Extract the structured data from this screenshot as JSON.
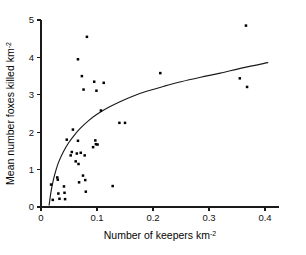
{
  "chart_data": {
    "type": "scatter",
    "title": "",
    "xlabel": "Number of keepers km-2",
    "xlabel_base": "Number of keepers km",
    "xlabel_sup": "-2",
    "ylabel": "Mean number foxes killed km-2",
    "ylabel_base": "Mean number foxes killed km",
    "ylabel_sup": "-2",
    "xlim": [
      0,
      0.4
    ],
    "ylim": [
      0,
      5
    ],
    "xticks": [
      0,
      0.1,
      0.2,
      0.3,
      0.4
    ],
    "xticklabels": [
      "0",
      "0.1",
      "0.2",
      "0.3",
      "0.4"
    ],
    "yticks": [
      0,
      1,
      2,
      3,
      4,
      5
    ],
    "yticklabels": [
      "0",
      "1",
      "2",
      "3",
      "4",
      "5"
    ],
    "grid": false,
    "legend": null,
    "marker": "square",
    "marker_color": "#000000",
    "points": [
      {
        "x": 0.018,
        "y": 0.6
      },
      {
        "x": 0.021,
        "y": 0.19
      },
      {
        "x": 0.029,
        "y": 0.79
      },
      {
        "x": 0.03,
        "y": 0.73
      },
      {
        "x": 0.031,
        "y": 0.36
      },
      {
        "x": 0.033,
        "y": 0.22
      },
      {
        "x": 0.041,
        "y": 0.55
      },
      {
        "x": 0.042,
        "y": 0.38
      },
      {
        "x": 0.043,
        "y": 0.21
      },
      {
        "x": 0.046,
        "y": 1.8
      },
      {
        "x": 0.053,
        "y": 1.38
      },
      {
        "x": 0.055,
        "y": 1.47
      },
      {
        "x": 0.057,
        "y": 2.07
      },
      {
        "x": 0.062,
        "y": 1.22
      },
      {
        "x": 0.064,
        "y": 1.43
      },
      {
        "x": 0.066,
        "y": 1.77
      },
      {
        "x": 0.066,
        "y": 3.95
      },
      {
        "x": 0.067,
        "y": 1.15
      },
      {
        "x": 0.068,
        "y": 0.66
      },
      {
        "x": 0.071,
        "y": 1.45
      },
      {
        "x": 0.073,
        "y": 3.5
      },
      {
        "x": 0.075,
        "y": 0.84
      },
      {
        "x": 0.076,
        "y": 3.14
      },
      {
        "x": 0.078,
        "y": 1.38
      },
      {
        "x": 0.079,
        "y": 0.72
      },
      {
        "x": 0.08,
        "y": 0.41
      },
      {
        "x": 0.082,
        "y": 4.55
      },
      {
        "x": 0.093,
        "y": 1.6
      },
      {
        "x": 0.095,
        "y": 3.35
      },
      {
        "x": 0.097,
        "y": 1.78
      },
      {
        "x": 0.098,
        "y": 1.68
      },
      {
        "x": 0.099,
        "y": 3.11
      },
      {
        "x": 0.101,
        "y": 1.67
      },
      {
        "x": 0.107,
        "y": 2.58
      },
      {
        "x": 0.112,
        "y": 3.32
      },
      {
        "x": 0.128,
        "y": 0.56
      },
      {
        "x": 0.14,
        "y": 2.25
      },
      {
        "x": 0.15,
        "y": 2.25
      },
      {
        "x": 0.213,
        "y": 3.58
      },
      {
        "x": 0.355,
        "y": 3.44
      },
      {
        "x": 0.366,
        "y": 4.85
      },
      {
        "x": 0.368,
        "y": 3.21
      }
    ],
    "fit_curve": {
      "name": "fitted-curve",
      "description": "logarithmic saturating fit",
      "points": [
        {
          "x": 0.0145,
          "y": 0.05
        },
        {
          "x": 0.018,
          "y": 0.42
        },
        {
          "x": 0.022,
          "y": 0.72
        },
        {
          "x": 0.027,
          "y": 1.0
        },
        {
          "x": 0.032,
          "y": 1.22
        },
        {
          "x": 0.04,
          "y": 1.48
        },
        {
          "x": 0.05,
          "y": 1.73
        },
        {
          "x": 0.06,
          "y": 1.93
        },
        {
          "x": 0.07,
          "y": 2.1
        },
        {
          "x": 0.085,
          "y": 2.31
        },
        {
          "x": 0.1,
          "y": 2.48
        },
        {
          "x": 0.12,
          "y": 2.66
        },
        {
          "x": 0.14,
          "y": 2.81
        },
        {
          "x": 0.165,
          "y": 2.97
        },
        {
          "x": 0.19,
          "y": 3.1
        },
        {
          "x": 0.22,
          "y": 3.23
        },
        {
          "x": 0.25,
          "y": 3.35
        },
        {
          "x": 0.285,
          "y": 3.47
        },
        {
          "x": 0.32,
          "y": 3.58
        },
        {
          "x": 0.36,
          "y": 3.72
        },
        {
          "x": 0.405,
          "y": 3.86
        }
      ]
    }
  }
}
